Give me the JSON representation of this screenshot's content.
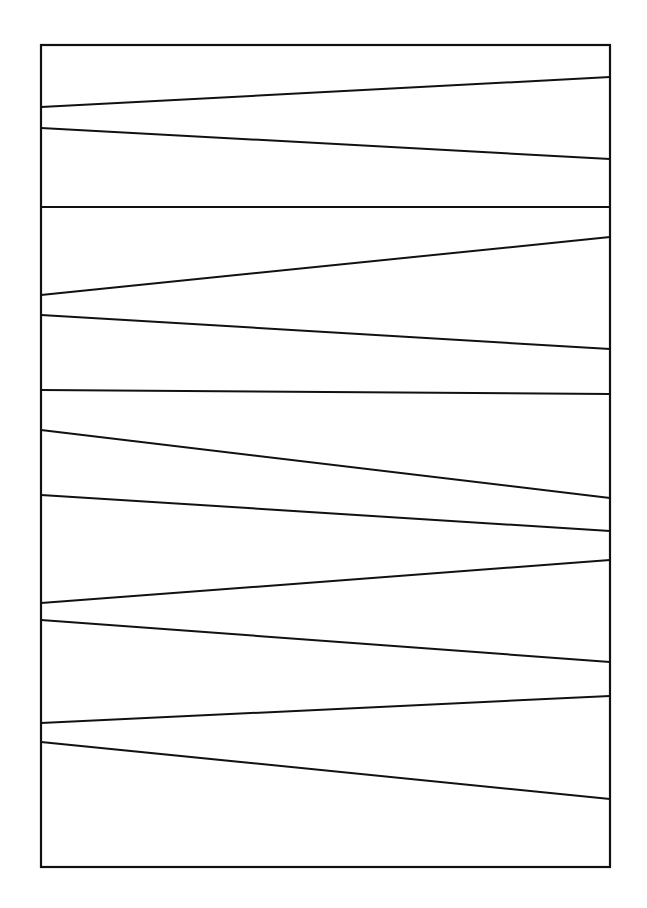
{
  "canvas": {
    "width": 647,
    "height": 908,
    "background": "#ffffff",
    "stroke": "#111111"
  },
  "frame": {
    "x1": 41,
    "y1": 45,
    "x2": 610,
    "y2": 867,
    "stroke_width": 2.2
  },
  "lines": [
    {
      "left_y": 107,
      "right_y": 77
    },
    {
      "left_y": 128,
      "right_y": 159
    },
    {
      "left_y": 207,
      "right_y": 207
    },
    {
      "left_y": 295,
      "right_y": 237
    },
    {
      "left_y": 315,
      "right_y": 349
    },
    {
      "left_y": 390,
      "right_y": 394
    },
    {
      "left_y": 430,
      "right_y": 498
    },
    {
      "left_y": 495,
      "right_y": 531
    },
    {
      "left_y": 603,
      "right_y": 560
    },
    {
      "left_y": 620,
      "right_y": 662
    },
    {
      "left_y": 723,
      "right_y": 696
    },
    {
      "left_y": 742,
      "right_y": 799
    }
  ],
  "line_stroke_width": 2
}
